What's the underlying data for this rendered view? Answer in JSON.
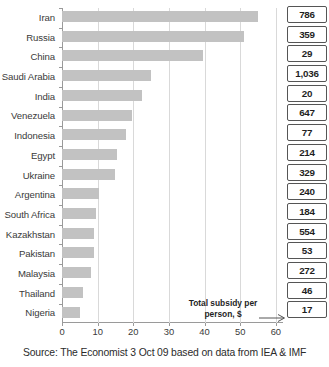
{
  "chart_data": {
    "type": "bar",
    "orientation": "horizontal",
    "title": "",
    "subtitle": "",
    "xlabel": "",
    "ylabel": "",
    "xlim": [
      0,
      62
    ],
    "xticks": [
      0,
      10,
      20,
      30,
      40,
      50,
      60
    ],
    "xtick_labels": [
      "0",
      "10",
      "20",
      "30",
      "40",
      "50",
      "60"
    ],
    "grid": true,
    "grid_axis": "x",
    "legend": false,
    "categories": [
      "Iran",
      "Russia",
      "China",
      "Saudi Arabia",
      "India",
      "Venezuela",
      "Indonesia",
      "Egypt",
      "Ukraine",
      "Argentina",
      "South Africa",
      "Kazakhstan",
      "Pakistan",
      "Malaysia",
      "Thailand",
      "Nigeria"
    ],
    "values": [
      55.0,
      51.0,
      39.5,
      25.0,
      22.5,
      19.5,
      18.0,
      15.5,
      15.0,
      10.5,
      9.5,
      9.0,
      9.0,
      8.2,
      6.0,
      5.0
    ],
    "annotation": {
      "line1": "Total subsidy per",
      "line2": "person, $",
      "arrow": "arrow-right"
    },
    "side_values_header": "Total subsidy per person, $",
    "side_values": [
      "786",
      "359",
      "29",
      "1,036",
      "20",
      "647",
      "77",
      "214",
      "329",
      "240",
      "184",
      "554",
      "53",
      "272",
      "46",
      "17"
    ],
    "bar_color": "#c2c2c2",
    "grid_color": "#d9d9d9",
    "axis_color": "#9a9a9a",
    "box_border_color": "#555555"
  },
  "source": "Source: The Economist 3 Oct 09 based on data from IEA & IMF"
}
